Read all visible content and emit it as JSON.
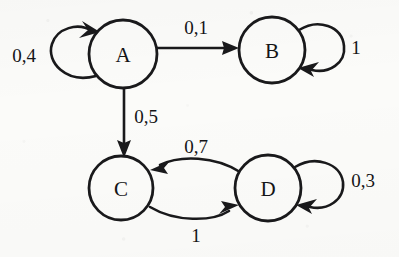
{
  "diagram": {
    "type": "finite-state-machine",
    "background_color": "#fbfbf9",
    "ink_color": "#19191b",
    "nodes": [
      {
        "id": "A",
        "label": "A",
        "cx": 123,
        "cy": 54,
        "r": 34
      },
      {
        "id": "B",
        "label": "B",
        "cx": 272,
        "cy": 50,
        "r": 33
      },
      {
        "id": "C",
        "label": "C",
        "cx": 121,
        "cy": 188,
        "r": 32
      },
      {
        "id": "D",
        "label": "D",
        "cx": 268,
        "cy": 188,
        "r": 33
      }
    ],
    "edges": [
      {
        "id": "a-self",
        "from": "A",
        "to": "A",
        "label": "0,4",
        "kind": "self-loop",
        "side": "left",
        "label_x": 24,
        "label_y": 55
      },
      {
        "id": "a-b",
        "from": "A",
        "to": "B",
        "label": "0,1",
        "kind": "straight",
        "label_x": 196,
        "label_y": 27
      },
      {
        "id": "b-self",
        "from": "B",
        "to": "B",
        "label": "1",
        "kind": "self-loop",
        "side": "right",
        "label_x": 356,
        "label_y": 47
      },
      {
        "id": "a-c",
        "from": "A",
        "to": "C",
        "label": "0,5",
        "kind": "straight",
        "label_x": 146,
        "label_y": 116
      },
      {
        "id": "d-c",
        "from": "D",
        "to": "C",
        "label": "0,7",
        "kind": "curve",
        "label_x": 196,
        "label_y": 146
      },
      {
        "id": "c-d",
        "from": "C",
        "to": "D",
        "label": "1",
        "kind": "curve",
        "label_x": 196,
        "label_y": 235
      },
      {
        "id": "d-self",
        "from": "D",
        "to": "D",
        "label": "0,3",
        "kind": "self-loop",
        "side": "right",
        "label_x": 363,
        "label_y": 180
      }
    ]
  }
}
